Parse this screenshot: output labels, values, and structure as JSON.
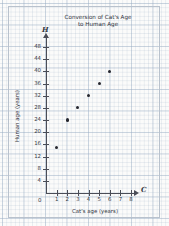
{
  "chart_data": {
    "type": "scatter",
    "title": "Conversion of Cat's Age to Human Age",
    "title_line1": "Conversion of Cat's Age",
    "title_line2": "to Human Age",
    "xlabel": "Cat's age (years)",
    "ylabel": "Human age (years)",
    "x_axis_variable": "C",
    "y_axis_variable": "H",
    "origin_label": "0",
    "xlim": [
      0,
      8
    ],
    "ylim": [
      0,
      50
    ],
    "x_ticks": [
      1,
      2,
      3,
      4,
      5,
      6,
      7,
      8
    ],
    "y_ticks": [
      4,
      8,
      12,
      16,
      20,
      24,
      28,
      32,
      36,
      40,
      44,
      48
    ],
    "x_tick_labels": [
      "1",
      "2",
      "3",
      "4",
      "5",
      "6",
      "7",
      "8"
    ],
    "y_tick_labels": [
      "4",
      "8",
      "12",
      "16",
      "20",
      "24",
      "28",
      "32",
      "36",
      "40",
      "44",
      "48"
    ],
    "grid": true,
    "legend": false,
    "x": [
      1,
      2,
      3,
      4,
      5,
      6
    ],
    "y": [
      15,
      24,
      28,
      32,
      36,
      40
    ],
    "points": [
      {
        "x": 1,
        "y": 15
      },
      {
        "x": 2,
        "y": 24
      },
      {
        "x": 3,
        "y": 28
      },
      {
        "x": 4,
        "y": 32
      },
      {
        "x": 5,
        "y": 36
      },
      {
        "x": 6,
        "y": 40
      }
    ],
    "marker": "filled-circle",
    "marker_color": "#24262e",
    "axis_color": "#4a4d57",
    "grid_color": "#96aac3",
    "paper_color": "#fbfbfa"
  }
}
